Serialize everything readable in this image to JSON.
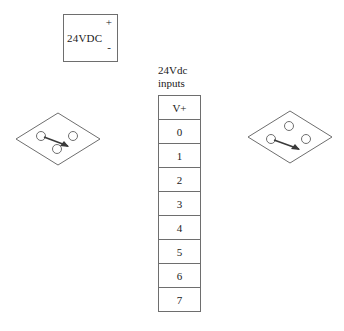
{
  "diagram": {
    "background_color": "#ffffff",
    "line_color": "#6e6e6e",
    "text_color": "#1a1a1a"
  },
  "power_supply": {
    "name": "24vdc-power-supply",
    "label": "24VDC",
    "positive_terminal": "+",
    "negative_terminal": "-"
  },
  "terminal_block": {
    "caption_line1": "24Vdc",
    "caption_line2": "inputs",
    "terminals": [
      {
        "label": "V+"
      },
      {
        "label": "0"
      },
      {
        "label": "1"
      },
      {
        "label": "2"
      },
      {
        "label": "3"
      },
      {
        "label": "4"
      },
      {
        "label": "5"
      },
      {
        "label": "6"
      },
      {
        "label": "7"
      }
    ]
  },
  "switches": [
    {
      "name": "switch-left",
      "shape": "diamond",
      "contacts": 3,
      "arrow_direction": "down-right",
      "layout": "two-top-one-bottom"
    },
    {
      "name": "switch-right",
      "shape": "diamond",
      "contacts": 3,
      "arrow_direction": "down-right",
      "layout": "one-top-two-bottom"
    }
  ]
}
